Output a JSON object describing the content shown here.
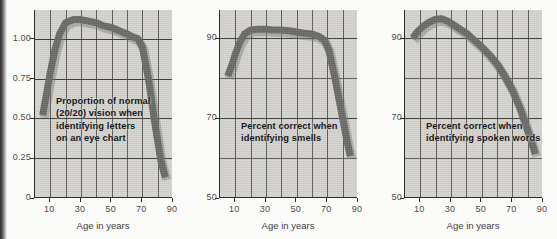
{
  "figure": {
    "background_color": "#fbfbfa",
    "plot_background_color": "#d6d5d1",
    "curve_color": "#6b6a68",
    "axis_color": "#2b2b2b",
    "grid_color": "#5d5c59"
  },
  "panels": [
    {
      "id": "vision",
      "annotation_lines": [
        "Proportion of normal",
        "(20/20) vision when",
        "identifying letters",
        "on an eye chart"
      ],
      "xlabel": "Age in years",
      "yticks": [
        "0",
        "0.25",
        "0.50",
        "0.75",
        "1.00"
      ],
      "ytick_values": [
        0,
        0.25,
        0.5,
        0.75,
        1.0
      ],
      "xticks": [
        "10",
        "30",
        "50",
        "70",
        "90"
      ],
      "xtick_values": [
        10,
        30,
        50,
        70,
        90
      ]
    },
    {
      "id": "smell",
      "annotation_lines": [
        "Percent correct when",
        "identifying smells"
      ],
      "xlabel": "Age in years",
      "yticks": [
        "50",
        "70",
        "90"
      ],
      "ytick_values": [
        50,
        70,
        90
      ],
      "xticks": [
        "10",
        "30",
        "50",
        "70",
        "90"
      ],
      "xtick_values": [
        10,
        30,
        50,
        70,
        90
      ]
    },
    {
      "id": "speech",
      "annotation_lines": [
        "Percent correct when",
        "identifying spoken words"
      ],
      "xlabel": "Age in years",
      "yticks": [
        "50",
        "70",
        "90"
      ],
      "ytick_values": [
        50,
        70,
        90
      ],
      "xticks": [
        "10",
        "30",
        "50",
        "70",
        "90"
      ],
      "xtick_values": [
        10,
        30,
        50,
        70,
        90
      ]
    }
  ],
  "chart_data": [
    {
      "type": "line",
      "title": "",
      "xlabel": "Age in years",
      "ylabel": "",
      "annotation": "Proportion of normal (20/20) vision when identifying letters on an eye chart",
      "xlim": [
        0,
        90
      ],
      "ylim": [
        0,
        1.18
      ],
      "xticks": [
        10,
        30,
        50,
        70,
        90
      ],
      "yticks": [
        0,
        0.25,
        0.5,
        0.75,
        1.0
      ],
      "grid": true,
      "x": [
        5,
        8,
        10,
        13,
        16,
        20,
        25,
        30,
        35,
        40,
        45,
        50,
        55,
        60,
        64,
        67,
        70,
        74,
        78,
        82,
        85
      ],
      "values": [
        0.52,
        0.68,
        0.79,
        0.93,
        1.03,
        1.1,
        1.12,
        1.12,
        1.11,
        1.1,
        1.08,
        1.07,
        1.05,
        1.03,
        1.01,
        1.0,
        0.95,
        0.75,
        0.48,
        0.24,
        0.13
      ]
    },
    {
      "type": "line",
      "title": "",
      "xlabel": "Age in years",
      "ylabel": "",
      "annotation": "Percent correct when identifying smells",
      "xlim": [
        0,
        90
      ],
      "ylim": [
        50,
        97
      ],
      "xticks": [
        10,
        30,
        50,
        70,
        90
      ],
      "yticks": [
        50,
        70,
        90
      ],
      "grid": true,
      "x": [
        5,
        8,
        10,
        13,
        16,
        20,
        25,
        30,
        35,
        40,
        45,
        50,
        55,
        60,
        64,
        68,
        71,
        75,
        79,
        83,
        85
      ],
      "values": [
        80.5,
        83.5,
        86.0,
        89.0,
        91.0,
        92.0,
        92.2,
        92.2,
        92.0,
        92.0,
        91.8,
        91.5,
        91.2,
        91.0,
        90.5,
        89.5,
        87.0,
        80.0,
        72.0,
        64.0,
        60.5
      ]
    },
    {
      "type": "line",
      "title": "",
      "xlabel": "Age in years",
      "ylabel": "",
      "annotation": "Percent correct when identifying spoken words",
      "xlim": [
        0,
        90
      ],
      "ylim": [
        50,
        97
      ],
      "xticks": [
        10,
        30,
        50,
        70,
        90
      ],
      "yticks": [
        50,
        70,
        90
      ],
      "grid": true,
      "x": [
        5,
        8,
        12,
        16,
        20,
        24,
        28,
        32,
        36,
        40,
        45,
        50,
        55,
        60,
        65,
        70,
        75,
        79,
        83,
        85
      ],
      "values": [
        90.0,
        91.5,
        93.0,
        94.0,
        94.7,
        94.8,
        94.2,
        93.2,
        92.2,
        91.2,
        89.5,
        87.8,
        85.8,
        83.5,
        80.5,
        77.0,
        72.5,
        68.0,
        63.5,
        61.0
      ]
    }
  ]
}
